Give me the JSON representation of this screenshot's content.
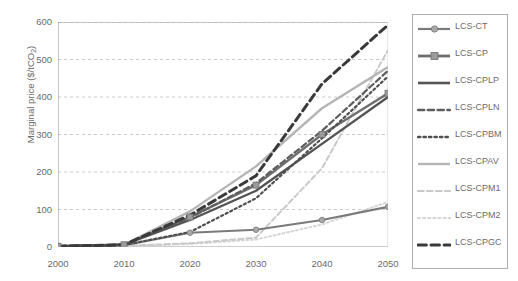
{
  "chart_data": {
    "type": "line",
    "title": "",
    "xlabel": "",
    "ylabel": "Marginal price ($/tCO2)",
    "ylabel_main": "Marginal price ($/tCO",
    "ylabel_sub": "2",
    "ylabel_tail": ")",
    "x": [
      2000,
      2010,
      2020,
      2030,
      2040,
      2050
    ],
    "xtick_labels": [
      "2000",
      "2010",
      "2020",
      "2030",
      "2040",
      "2050"
    ],
    "ytick_labels": [
      "0",
      "100",
      "200",
      "300",
      "400",
      "500",
      "600"
    ],
    "yticks": [
      0,
      100,
      200,
      300,
      400,
      500,
      600
    ],
    "ylim": [
      0,
      600
    ],
    "xlim": [
      2000,
      2050
    ],
    "grid": "horizontal-dashed",
    "legend_position": "right-outside",
    "series": [
      {
        "name": "LCS-CT",
        "color": "#7a7a7a",
        "style": "solid",
        "width": 2.2,
        "marker": "circle",
        "values": [
          2,
          5,
          38,
          46,
          72,
          107
        ]
      },
      {
        "name": "LCS-CP",
        "color": "#6e6e6e",
        "style": "solid",
        "width": 2.4,
        "marker": "square",
        "values": [
          2,
          6,
          80,
          165,
          300,
          410
        ]
      },
      {
        "name": "LCS-CPLP",
        "color": "#545454",
        "style": "solid",
        "width": 2.4,
        "marker": "none",
        "values": [
          2,
          6,
          72,
          150,
          275,
          400
        ]
      },
      {
        "name": "LCS-CPLN",
        "color": "#5d5d5d",
        "style": "dashed",
        "width": 2.2,
        "marker": "none",
        "values": [
          2,
          6,
          78,
          170,
          310,
          470
        ]
      },
      {
        "name": "LCS-CPBM",
        "color": "#4f4f4f",
        "style": "dotted",
        "width": 2.2,
        "marker": "none",
        "values": [
          2,
          5,
          40,
          130,
          290,
          455
        ]
      },
      {
        "name": "LCS-CPAV",
        "color": "#b5b5b5",
        "style": "solid",
        "width": 2.4,
        "marker": "none",
        "values": [
          2,
          6,
          95,
          215,
          370,
          480
        ]
      },
      {
        "name": "LCS-CPM1",
        "color": "#c9c9c9",
        "style": "dashed",
        "width": 2.0,
        "marker": "none",
        "values": [
          1,
          3,
          10,
          25,
          210,
          525
        ]
      },
      {
        "name": "LCS-CPM2",
        "color": "#d6d6d6",
        "style": "dotted",
        "width": 2.0,
        "marker": "none",
        "values": [
          1,
          2,
          8,
          20,
          60,
          120
        ]
      },
      {
        "name": "LCS-CPGC",
        "color": "#3a3a3a",
        "style": "dashed",
        "width": 3.0,
        "marker": "none",
        "values": [
          2,
          6,
          85,
          190,
          435,
          592
        ]
      }
    ]
  },
  "legend": {
    "items": [
      {
        "label": "LCS-CT",
        "marker": "circle",
        "style": "solid",
        "color": "#7a7a7a",
        "width": 2.2
      },
      {
        "label": "LCS-CP",
        "marker": "square",
        "style": "solid",
        "color": "#6e6e6e",
        "width": 2.8
      },
      {
        "label": "LCS-CPLP",
        "marker": "none",
        "style": "solid",
        "color": "#545454",
        "width": 2.6
      },
      {
        "label": "LCS-CPLN",
        "marker": "none",
        "style": "dashed",
        "color": "#5d5d5d",
        "width": 2.4
      },
      {
        "label": "LCS-CPBM",
        "marker": "none",
        "style": "dotted",
        "color": "#4f4f4f",
        "width": 2.4
      },
      {
        "label": "LCS-CPAV",
        "marker": "none",
        "style": "solid",
        "color": "#b5b5b5",
        "width": 2.4
      },
      {
        "label": "LCS-CPM1",
        "marker": "none",
        "style": "dashed",
        "color": "#c9c9c9",
        "width": 2.2
      },
      {
        "label": "LCS-CPM2",
        "marker": "none",
        "style": "dotted",
        "color": "#d6d6d6",
        "width": 2.2
      },
      {
        "label": "LCS-CPGC",
        "marker": "none",
        "style": "dashed",
        "color": "#3a3a3a",
        "width": 3.2
      }
    ]
  }
}
